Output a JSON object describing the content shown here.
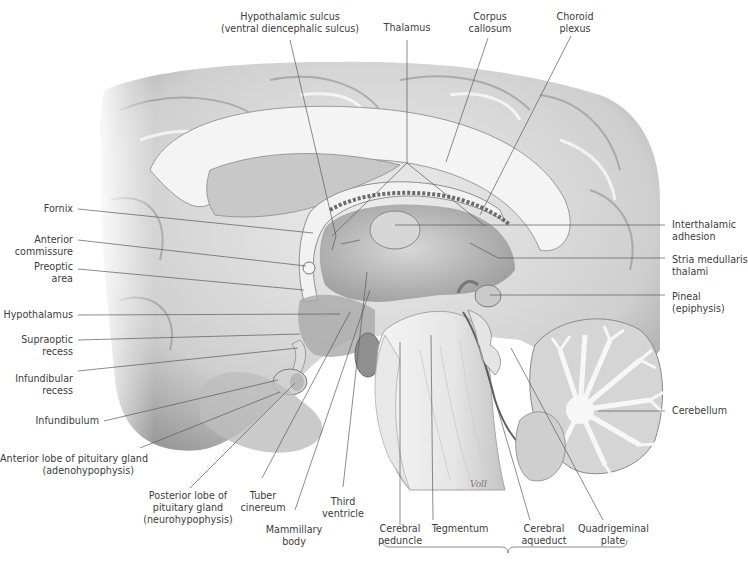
{
  "figure": {
    "signature": "Voll",
    "colors": {
      "background": "#ffffff",
      "label_text": "#3c3c3c",
      "leader_line": "#555555",
      "tissue_light": "#e6e6e6",
      "tissue_mid": "#bdbdbd",
      "tissue_dark": "#6f6f6f"
    }
  },
  "labels": {
    "top": [
      {
        "id": "hypothalamic-sulcus",
        "lines": [
          "Hypothalamic sulcus",
          "(ventral diencephalic sulcus)"
        ]
      },
      {
        "id": "thalamus",
        "lines": [
          "Thalamus"
        ]
      },
      {
        "id": "corpus-callosum",
        "lines": [
          "Corpus",
          "callosum"
        ]
      },
      {
        "id": "choroid-plexus",
        "lines": [
          "Choroid",
          "plexus"
        ]
      }
    ],
    "left": [
      {
        "id": "fornix",
        "lines": [
          "Fornix"
        ]
      },
      {
        "id": "anterior-commissure",
        "lines": [
          "Anterior",
          "commissure"
        ]
      },
      {
        "id": "preoptic-area",
        "lines": [
          "Preoptic",
          "area"
        ]
      },
      {
        "id": "hypothalamus",
        "lines": [
          "Hypothalamus"
        ]
      },
      {
        "id": "supraoptic-recess",
        "lines": [
          "Supraoptic",
          "recess"
        ]
      },
      {
        "id": "infundibular-recess",
        "lines": [
          "Infundibular",
          "recess"
        ]
      },
      {
        "id": "infundibulum",
        "lines": [
          "Infundibulum"
        ]
      },
      {
        "id": "anterior-lobe-pituitary",
        "lines": [
          "Anterior lobe of pituitary gland",
          "(adenohypophysis)"
        ]
      }
    ],
    "right": [
      {
        "id": "interthalamic-adhesion",
        "lines": [
          "Interthalamic",
          "adhesion"
        ]
      },
      {
        "id": "stria-medullaris",
        "lines": [
          "Stria medullaris",
          "thalami"
        ]
      },
      {
        "id": "pineal",
        "lines": [
          "Pineal",
          "(epiphysis)"
        ]
      },
      {
        "id": "cerebellum",
        "lines": [
          "Cerebellum"
        ]
      }
    ],
    "bottom": [
      {
        "id": "posterior-lobe-pituitary",
        "lines": [
          "Posterior lobe of",
          "pituitary gland",
          "(neurohypophysis)"
        ]
      },
      {
        "id": "tuber-cinereum",
        "lines": [
          "Tuber",
          "cinereum"
        ]
      },
      {
        "id": "mammillary-body",
        "lines": [
          "Mammillary",
          "body"
        ]
      },
      {
        "id": "third-ventricle",
        "lines": [
          "Third",
          "ventricle"
        ]
      },
      {
        "id": "cerebral-peduncle",
        "lines": [
          "Cerebral",
          "peduncle"
        ]
      },
      {
        "id": "tegmentum",
        "lines": [
          "Tegmentum"
        ]
      },
      {
        "id": "cerebral-aqueduct",
        "lines": [
          "Cerebral",
          "aqueduct"
        ]
      },
      {
        "id": "quadrigeminal-plate",
        "lines": [
          "Quadrigeminal",
          "plate"
        ]
      }
    ]
  },
  "text": {
    "hypothalamic_sulcus_1": "Hypothalamic sulcus",
    "hypothalamic_sulcus_2": "(ventral diencephalic sulcus)",
    "thalamus": "Thalamus",
    "corpus_callosum_1": "Corpus",
    "corpus_callosum_2": "callosum",
    "choroid_plexus_1": "Choroid",
    "choroid_plexus_2": "plexus",
    "fornix": "Fornix",
    "anterior_commissure_1": "Anterior",
    "anterior_commissure_2": "commissure",
    "preoptic_1": "Preoptic",
    "preoptic_2": "area",
    "hypothalamus": "Hypothalamus",
    "supraoptic_1": "Supraoptic",
    "supraoptic_2": "recess",
    "infundibular_1": "Infundibular",
    "infundibular_2": "recess",
    "infundibulum": "Infundibulum",
    "anterior_lobe_1": "Anterior lobe of pituitary gland",
    "anterior_lobe_2": "(adenohypophysis)",
    "interthalamic_1": "Interthalamic",
    "interthalamic_2": "adhesion",
    "stria_1": "Stria medullaris",
    "stria_2": "thalami",
    "pineal_1": "Pineal",
    "pineal_2": "(epiphysis)",
    "cerebellum": "Cerebellum",
    "posterior_lobe_1": "Posterior lobe of",
    "posterior_lobe_2": "pituitary gland",
    "posterior_lobe_3": "(neurohypophysis)",
    "tuber_1": "Tuber",
    "tuber_2": "cinereum",
    "mammillary_1": "Mammillary",
    "mammillary_2": "body",
    "third_ventricle_1": "Third",
    "third_ventricle_2": "ventricle",
    "cerebral_peduncle_1": "Cerebral",
    "cerebral_peduncle_2": "peduncle",
    "tegmentum": "Tegmentum",
    "aqueduct_1": "Cerebral",
    "aqueduct_2": "aqueduct",
    "quadrigeminal_1": "Quadrigeminal",
    "quadrigeminal_2": "plate",
    "signature": "Voll"
  }
}
